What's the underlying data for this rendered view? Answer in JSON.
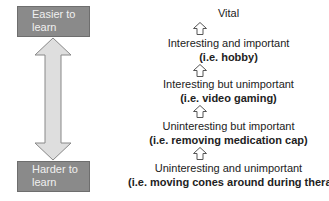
{
  "scale": {
    "top_label": "Easier to learn",
    "bottom_label": "Harder to learn",
    "box_color": "#8a8a8a",
    "arrow_fill": "#dedede"
  },
  "hierarchy": [
    {
      "label": "Vital",
      "example": ""
    },
    {
      "label": "Interesting and important",
      "example": "(i.e. hobby)"
    },
    {
      "label": "Interesting but unimportant",
      "example": "(i.e. video gaming)"
    },
    {
      "label": "Uninteresting but important",
      "example": "(i.e. removing medication cap)"
    },
    {
      "label": "Uninteresting and unimportant",
      "example": "(i.e. moving cones around during therapy)"
    }
  ]
}
